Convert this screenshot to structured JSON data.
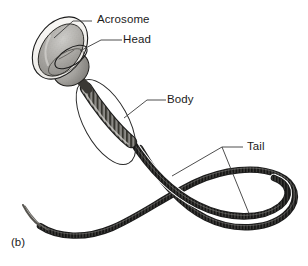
{
  "figure": {
    "caption": "(b)",
    "background_color": "#ffffff",
    "ink_color": "#1b1b1b",
    "labels": [
      {
        "id": "acrosome",
        "text": "Acrosome",
        "points_to": "acrosome-cap",
        "leader": {
          "text_x": 92,
          "text_y": 21,
          "elbow_x": 73,
          "elbow_y": 21,
          "tip_x": 54,
          "tip_y": 38
        }
      },
      {
        "id": "head",
        "text": "Head",
        "points_to": "head-nucleus",
        "leader": {
          "text_x": 122,
          "text_y": 40,
          "elbow_x": 101,
          "elbow_y": 40,
          "tip_x": 80,
          "tip_y": 51
        }
      },
      {
        "id": "body",
        "text": "Body",
        "points_to": "midpiece",
        "leader": {
          "text_x": 166,
          "text_y": 100,
          "elbow_x": 147,
          "elbow_y": 100,
          "tip_x": 124,
          "tip_y": 118
        }
      },
      {
        "id": "tail",
        "text": "Tail",
        "points_to": "flagellum",
        "leader": {
          "text_x": 243,
          "text_y": 147,
          "vertex_x": 222,
          "vertex_y": 147,
          "tip1_x": 172,
          "tip1_y": 176,
          "tip2_x": 250,
          "tip2_y": 216
        }
      }
    ],
    "parts": {
      "acrosome": {
        "name": "Acrosome",
        "description": "outer cap outline over the anterior head",
        "fill": "#f2f1ee",
        "stroke": "#1b1b1b"
      },
      "head": {
        "name": "Head",
        "description": "shaded ovoid nucleus with stippled texture",
        "fill": "#a9a7a3",
        "stroke": "#1b1b1b"
      },
      "body": {
        "name": "Body",
        "description": "striated midpiece with surrounding oval membrane outline",
        "fill": "#6e6c69",
        "stroke": "#1b1b1b"
      },
      "tail": {
        "name": "Tail",
        "description": "long banded flagellum crossing itself into a loop and tapering to a fine tip",
        "fill": "#2a2a2a",
        "stroke": "#1b1b1b"
      }
    }
  }
}
